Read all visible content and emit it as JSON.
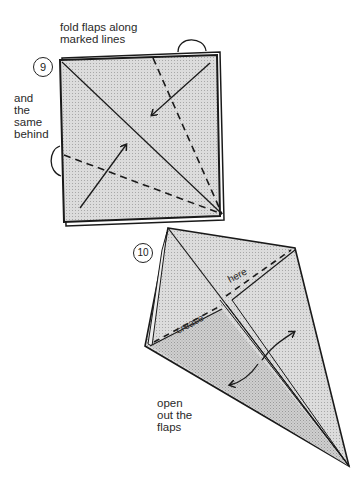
{
  "steps": [
    {
      "number": "9",
      "instruction": "fold flaps along marked lines",
      "instruction_lines": [
        "fold flaps along",
        "marked lines"
      ],
      "side_note_lines": [
        "and",
        "the",
        "same",
        "behind"
      ]
    },
    {
      "number": "10",
      "crease_label_1": "crease",
      "crease_label_2": "here",
      "instruction_lines": [
        "open",
        "out the",
        "flaps"
      ]
    }
  ],
  "colors": {
    "paper_fill": "#d6d6d6",
    "paper_inner_fill": "#c6c6c6",
    "line": "#1a1a1a",
    "background": "#ffffff"
  },
  "icons": [
    "fold-arrow-icon",
    "open-flap-arrow-icon",
    "turn-over-loop-icon"
  ]
}
